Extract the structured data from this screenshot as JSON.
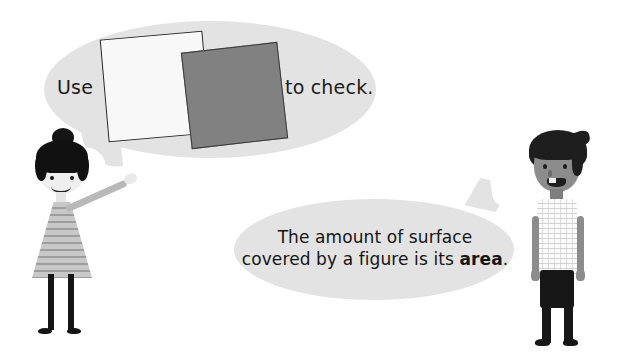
{
  "scene": {
    "title": "Area concept illustration with two children and speech bubbles",
    "background_color": "#ffffff"
  },
  "bubbles": [
    {
      "id": "bubble-1",
      "speaker": "girl",
      "fill_color": "#e3e3e3",
      "text_before": "Use",
      "text_after": "to check.",
      "contains": "two overlapping squares"
    },
    {
      "id": "bubble-2",
      "speaker": "boy",
      "fill_color": "#e3e3e3",
      "line_1": "The amount of surface",
      "line_2_plain": "covered by a figure is its ",
      "line_2_bold": "area",
      "line_2_end": "."
    }
  ],
  "shapes": {
    "white_square": {
      "label": "white-square",
      "fill": "#f8f8f8",
      "stroke": "#262626"
    },
    "gray_square": {
      "label": "gray-square",
      "fill": "#818181",
      "stroke": "#3a3a3a"
    }
  },
  "characters": {
    "girl": {
      "name": "girl-figure",
      "hair_color": "#111111",
      "skin_color": "#efefef",
      "dress_color": "#c8c8c8",
      "pose": "pointing up at the speech bubble"
    },
    "boy": {
      "name": "boy-figure",
      "hair_color": "#1e1e1e",
      "skin_color": "#8c8c8c",
      "shirt_color": "#fbfbfb",
      "pants_color": "#171717",
      "pose": "standing, arms at sides, smiling"
    }
  }
}
